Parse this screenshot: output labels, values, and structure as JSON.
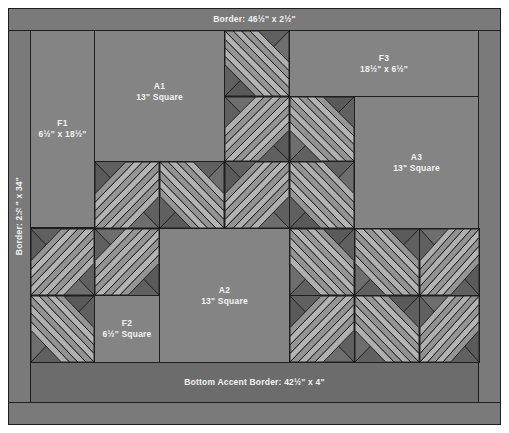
{
  "colors": {
    "border": "#7a7a7a",
    "plain": "#848484",
    "accent": "#6c6c6c",
    "light_strip": "#b4b4b4",
    "mid_strip": "#959595",
    "dark_triangle": "#606060",
    "outline": "#1e1e1e"
  },
  "pieces": {
    "top_border": {
      "label": "Border: 46½\" x 2½\""
    },
    "left_border": {
      "label": "Border: 2½\" x 34\""
    },
    "f1": {
      "name": "F1",
      "size": "6½\" x 18½\""
    },
    "a1": {
      "name": "A1",
      "size": "13\" Square"
    },
    "f3": {
      "name": "F3",
      "size": "18½\" x 6½\""
    },
    "a3": {
      "name": "A3",
      "size": "13\" Square"
    },
    "a2": {
      "name": "A2",
      "size": "13\" Square"
    },
    "f2": {
      "name": "F2",
      "size": "6½\" Square"
    },
    "bottom_accent": {
      "label": "Bottom Accent Border: 42½\" x 4\""
    }
  },
  "blocks": [
    {
      "id": "b-r1c4",
      "orient": "tl"
    },
    {
      "id": "b-r2c4",
      "orient": "bl"
    },
    {
      "id": "b-r2c5",
      "orient": "br"
    },
    {
      "id": "b-r3c2",
      "orient": "tr"
    },
    {
      "id": "b-r3c3",
      "orient": "tl"
    },
    {
      "id": "b-r3c4",
      "orient": "tr"
    },
    {
      "id": "b-r3c5",
      "orient": "tl"
    },
    {
      "id": "b-r4c1",
      "orient": "tr"
    },
    {
      "id": "b-r4c2",
      "orient": "bl"
    },
    {
      "id": "b-r4c5",
      "orient": "br"
    },
    {
      "id": "b-r4c6",
      "orient": "br"
    },
    {
      "id": "b-r4c7",
      "orient": "bl"
    },
    {
      "id": "b-r5c1",
      "orient": "br"
    },
    {
      "id": "b-r5c5",
      "orient": "tr"
    },
    {
      "id": "b-r5c6",
      "orient": "br"
    },
    {
      "id": "b-r5c7",
      "orient": "bl"
    }
  ]
}
